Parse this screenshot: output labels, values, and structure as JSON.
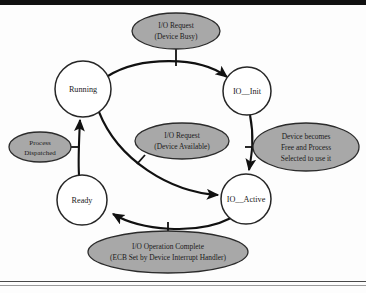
{
  "figure": {
    "kind": "state-transition-diagram",
    "background_color": "#fdfdfd",
    "state_fill": "#ffffff",
    "state_stroke": "#262626",
    "label_fill": "#a8a8a8",
    "label_stroke": "#2b2b2b",
    "edge_color": "#111111"
  },
  "states": [
    {
      "id": "running",
      "label": "Running",
      "cx": 83,
      "cy": 89,
      "r": 28
    },
    {
      "id": "io_init",
      "label": "IO__Init",
      "cx": 247,
      "cy": 91,
      "r": 24
    },
    {
      "id": "ready",
      "label": "Ready",
      "cx": 82,
      "cy": 200,
      "r": 25
    },
    {
      "id": "io_active",
      "label": "IO__Active",
      "cx": 246,
      "cy": 199,
      "r": 25
    }
  ],
  "edge_labels": [
    {
      "id": "io-request-device-busy",
      "lines": [
        "I/O Request",
        "(Device Busy)"
      ],
      "cx": 176,
      "cy": 31,
      "rx": 44,
      "ry": 18
    },
    {
      "id": "io-request-device-available",
      "lines": [
        "I/O Request",
        "(Device Available)"
      ],
      "cx": 182,
      "cy": 141,
      "rx": 47,
      "ry": 18
    },
    {
      "id": "process-dispatched",
      "lines": [
        "Process",
        "Dispatched"
      ],
      "cx": 40,
      "cy": 147,
      "rx": 31,
      "ry": 15
    },
    {
      "id": "device-becomes-free",
      "lines": [
        "Device becomes",
        "Free and Process",
        "Selected to use it"
      ],
      "cx": 306,
      "cy": 147,
      "rx": 53,
      "ry": 24
    },
    {
      "id": "io-operation-complete",
      "lines": [
        "I/O Operation Complete",
        "(ECB Set by Device Interrupt Handler)"
      ],
      "cx": 168,
      "cy": 252,
      "rx": 80,
      "ry": 21
    }
  ],
  "transitions": [
    {
      "id": "running-to-io-init",
      "from": "Running",
      "to": "IO__Init",
      "label": "I/O Request (Device Busy)"
    },
    {
      "id": "io-init-to-io-active",
      "from": "IO__Init",
      "to": "IO__Active",
      "label": "Device becomes Free and Process Selected to use it"
    },
    {
      "id": "running-to-io-active",
      "from": "Running",
      "to": "IO__Active",
      "label": "I/O Request (Device Available)"
    },
    {
      "id": "io-active-to-ready",
      "from": "IO__Active",
      "to": "Ready",
      "label": "I/O Operation Complete (ECB Set by Device Interrupt Handler)"
    },
    {
      "id": "ready-to-running",
      "from": "Ready",
      "to": "Running",
      "label": "Process Dispatched"
    }
  ]
}
